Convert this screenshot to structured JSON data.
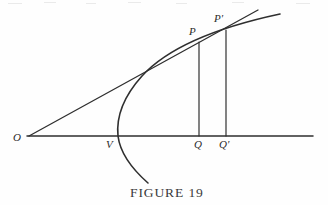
{
  "figure": {
    "caption": "FIGURE 19",
    "background_color": "#fefefe",
    "ink_color": "#2f2f2f",
    "labels": {
      "origin": "O",
      "vertex": "V",
      "point_p": "P",
      "point_p_prime": "P′",
      "foot_q": "Q",
      "foot_q_prime": "Q′"
    }
  },
  "chart_data": {
    "type": "line",
    "title": "FIGURE 19",
    "xlabel": "",
    "ylabel": "",
    "grid": false,
    "legend": null,
    "axis": {
      "name": "horizontal-axis",
      "x_start": 27,
      "x_end": 313,
      "y": 136
    },
    "points": [
      {
        "name": "O",
        "label": "O",
        "x": 29,
        "y": 136,
        "label_x": 13,
        "label_y": 132
      },
      {
        "name": "V",
        "label": "V",
        "x": 118,
        "y": 136,
        "label_x": 106,
        "label_y": 139
      },
      {
        "name": "P",
        "label": "P",
        "x": 199,
        "y": 42,
        "label_x": 189,
        "label_y": 26
      },
      {
        "name": "P_prime",
        "label": "P′",
        "x": 226,
        "y": 30,
        "label_x": 214,
        "label_y": 13
      },
      {
        "name": "Q",
        "label": "Q",
        "x": 199,
        "y": 136,
        "label_x": 194,
        "label_y": 139
      },
      {
        "name": "Q_prime",
        "label": "Q′",
        "x": 226,
        "y": 136,
        "label_x": 219,
        "label_y": 139
      }
    ],
    "series": [
      {
        "name": "parabola",
        "kind": "curve",
        "path": "M 148 183 C 131 168 120 152 118 136 C 116 116 124 96 142 76 C 163 53 205 30 280 14"
      },
      {
        "name": "secant-line",
        "kind": "line",
        "path": "M 29 136 L 258 10"
      },
      {
        "name": "ordinate-PQ",
        "kind": "line",
        "path": "M 199 42 L 199 136"
      },
      {
        "name": "ordinate-PprimeQprime",
        "kind": "line",
        "path": "M 226 30 L 226 136"
      }
    ],
    "scan_artifacts": [
      {
        "x": 8,
        "y": 3,
        "width": 14
      },
      {
        "x": 44,
        "y": 2,
        "width": 12
      },
      {
        "x": 86,
        "y": 3,
        "width": 10
      },
      {
        "x": 128,
        "y": 2,
        "width": 13
      },
      {
        "x": 176,
        "y": 3,
        "width": 11
      },
      {
        "x": 232,
        "y": 2,
        "width": 12
      },
      {
        "x": 296,
        "y": 3,
        "width": 14
      }
    ]
  },
  "caption_position": {
    "x": 130,
    "y": 185
  }
}
